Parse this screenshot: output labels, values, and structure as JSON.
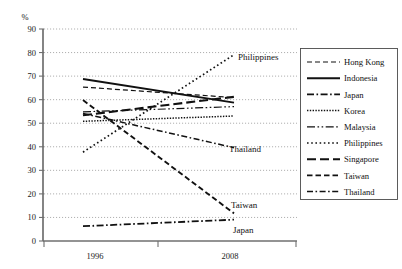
{
  "chart_data": {
    "type": "line",
    "title": "",
    "subtitle": "",
    "xlabel": "",
    "ylabel": "%",
    "y_unit_label": "%",
    "categories": [
      "1996",
      "2008"
    ],
    "x": [
      1996,
      2008
    ],
    "ylim": [
      0,
      90
    ],
    "yticks": [
      0,
      10,
      20,
      30,
      40,
      50,
      60,
      70,
      80,
      90
    ],
    "ytick_labels": [
      "0",
      "10",
      "20",
      "30",
      "40",
      "50",
      "60",
      "70",
      "80",
      "90"
    ],
    "xtick_labels": [
      "1996",
      "2008"
    ],
    "grid": "horizontal-dotted",
    "legend_position": "right-outside",
    "series": [
      {
        "name": "Hong Kong",
        "values": [
          65,
          61
        ],
        "dash": "5 3",
        "width": 1.2
      },
      {
        "name": "Indonesia",
        "values": [
          68,
          59
        ],
        "dash": "none",
        "width": 1.9
      },
      {
        "name": "Japan",
        "values": [
          6.5,
          9
        ],
        "dash": "7 2.5 1.6 2.5",
        "width": 1.8
      },
      {
        "name": "Korea",
        "values": [
          51,
          53
        ],
        "dash": "1.4 1.4",
        "width": 1.5
      },
      {
        "name": "Malaysia",
        "values": [
          55,
          57
        ],
        "dash": "8 2.5 1.6 2.5 1.6 2.5",
        "width": 1.2
      },
      {
        "name": "Philippines",
        "values": [
          41,
          78
        ],
        "dash": "1.6 2.6",
        "width": 1.7
      },
      {
        "name": "Singapore",
        "values": [
          54,
          61
        ],
        "dash": "9 4",
        "width": 2.1
      },
      {
        "name": "Taiwan",
        "values": [
          56,
          13
        ],
        "dash": "5.5 3",
        "width": 1.9
      },
      {
        "name": "Thailand",
        "values": [
          53,
          40
        ],
        "dash": "6 2.5 1.6 2.5",
        "width": 1.5
      }
    ],
    "annotations": [
      {
        "text": "Philippines",
        "series": "Philippines",
        "x": 238,
        "y": 60
      },
      {
        "text": "Thailand",
        "series": "Thailand",
        "x": 229,
        "y": 152
      },
      {
        "text": "Taiwan",
        "series": "Taiwan",
        "x": 231,
        "y": 208
      },
      {
        "text": "Japan",
        "series": "Japan",
        "x": 233,
        "y": 233
      }
    ],
    "legend_entries": [
      "Hong Kong",
      "Indonesia",
      "Japan",
      "Korea",
      "Malaysia",
      "Philippines",
      "Singapore",
      "Taiwan",
      "Thailand"
    ]
  },
  "colors": {
    "ink": "#111111",
    "axis": "#6f6f6f",
    "grid": "#8d8d8d",
    "legend_border": "#4a4a4a",
    "background": "#ffffff"
  }
}
